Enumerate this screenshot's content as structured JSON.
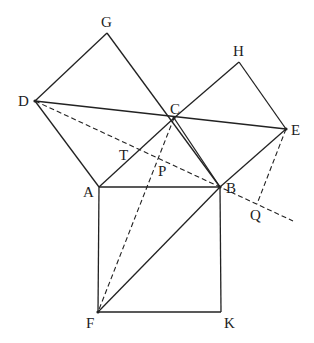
{
  "diagram": {
    "type": "geometry",
    "colors": {
      "stroke": "#222222",
      "background": "#ffffff"
    },
    "points": {
      "A": [
        99,
        187
      ],
      "B": [
        220,
        187
      ],
      "C": [
        174,
        118
      ],
      "D": [
        35,
        101
      ],
      "E": [
        286,
        129
      ],
      "F": [
        98,
        312
      ],
      "G": [
        107,
        33
      ],
      "H": [
        239,
        62
      ],
      "K": [
        221,
        312
      ],
      "T": [
        140,
        150
      ],
      "P": [
        160,
        158
      ],
      "Q": [
        257,
        204
      ]
    },
    "labels": [
      {
        "text": "G",
        "x": 101,
        "y": 27
      },
      {
        "text": "H",
        "x": 233,
        "y": 56
      },
      {
        "text": "D",
        "x": 18,
        "y": 106
      },
      {
        "text": "C",
        "x": 170,
        "y": 114
      },
      {
        "text": "E",
        "x": 291,
        "y": 135
      },
      {
        "text": "T",
        "x": 119,
        "y": 160
      },
      {
        "text": "P",
        "x": 158,
        "y": 176
      },
      {
        "text": "A",
        "x": 83,
        "y": 197
      },
      {
        "text": "B",
        "x": 226,
        "y": 193
      },
      {
        "text": "Q",
        "x": 250,
        "y": 220
      },
      {
        "text": "F",
        "x": 86,
        "y": 328
      },
      {
        "text": "K",
        "x": 224,
        "y": 328
      }
    ],
    "solid_segments": [
      [
        "A",
        "B"
      ],
      [
        "B",
        "C"
      ],
      [
        "C",
        "A"
      ],
      [
        "A",
        "D"
      ],
      [
        "D",
        "G"
      ],
      [
        "G",
        "B"
      ],
      [
        "C",
        "H"
      ],
      [
        "H",
        "E"
      ],
      [
        "E",
        "B"
      ],
      [
        "A",
        "F"
      ],
      [
        "F",
        "K"
      ],
      [
        "K",
        "B"
      ],
      [
        "D",
        "E"
      ],
      [
        "F",
        "B"
      ]
    ],
    "dashed_segments": [
      [
        "D",
        "B"
      ],
      [
        "C",
        "F"
      ],
      [
        "E",
        "Q"
      ]
    ],
    "dashed_extension_end": [
      293,
      221
    ]
  }
}
